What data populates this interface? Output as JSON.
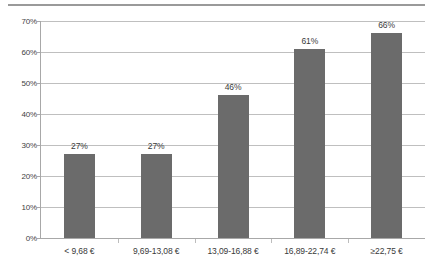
{
  "chart_data": {
    "type": "bar",
    "title": "",
    "subtitle": "",
    "xlabel": "",
    "ylabel": "",
    "categories": [
      "< 9,68 €",
      "9,69-13,08 €",
      "13,09-16,88 €",
      "16,89-22,74 €",
      "≥22,75 €"
    ],
    "values": [
      27,
      46,
      61,
      66,
      27
    ],
    "series": [
      {
        "name": "",
        "values": [
          27,
          27,
          46,
          61,
          66
        ]
      }
    ],
    "data_labels": [
      "27%",
      "27%",
      "46%",
      "61%",
      "66%"
    ],
    "ylim": [
      0,
      70
    ],
    "ytick_values": [
      0,
      10,
      20,
      30,
      40,
      50,
      60,
      70
    ],
    "ytick_labels": [
      "0%",
      "10%",
      "20%",
      "30%",
      "40%",
      "50%",
      "60%",
      "70%"
    ],
    "grid": true,
    "legend": false,
    "legend_position": "none",
    "bar_color": "#6b6b6b",
    "gridline_color": "#bfbfbf",
    "axis_color": "#a8a8a8",
    "text_color": "#3a3a3a",
    "background_color": "#ffffff"
  },
  "decoration": {
    "top_rule_color": "#9a9a9a"
  }
}
